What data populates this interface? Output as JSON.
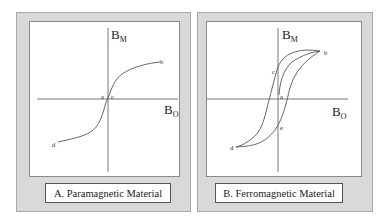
{
  "panels": [
    {
      "id": "A",
      "caption": "A. Paramagnetic Material",
      "y_axis_label": "B",
      "y_axis_sub": "M",
      "x_axis_label": "B",
      "x_axis_sub": "O",
      "points": [
        "a",
        "b",
        "c",
        "d"
      ]
    },
    {
      "id": "B",
      "caption": "B. Ferromagnetic Material",
      "y_axis_label": "B",
      "y_axis_sub": "M",
      "x_axis_label": "B",
      "x_axis_sub": "O",
      "points": [
        "a",
        "b",
        "c",
        "d",
        "e"
      ]
    }
  ],
  "colors": {
    "frame": "#d9d9d9",
    "curve": "#555555",
    "axis": "#555555"
  }
}
